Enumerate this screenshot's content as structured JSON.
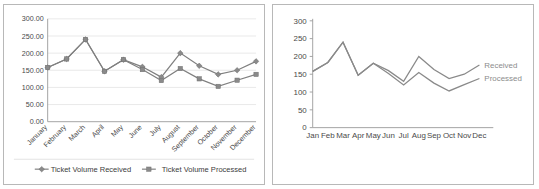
{
  "chart_data": [
    {
      "type": "line",
      "id": "left-original-chart",
      "title": "",
      "xlabel": "",
      "ylabel": "",
      "grid": true,
      "markers": true,
      "legend_position": "bottom",
      "ylim": [
        0,
        300
      ],
      "ytick_labels": [
        "0.00",
        "50.00",
        "100.00",
        "150.00",
        "200.00",
        "250.00",
        "300.00"
      ],
      "ytick_values": [
        0,
        50,
        100,
        150,
        200,
        250,
        300
      ],
      "categories": [
        "January",
        "February",
        "March",
        "April",
        "May",
        "June",
        "July",
        "August",
        "September",
        "October",
        "November",
        "December"
      ],
      "series": [
        {
          "name": "Ticket Volume Received",
          "marker": "diamond",
          "color": "#808080",
          "values": [
            158,
            183,
            240,
            147,
            181,
            160,
            130,
            200,
            163,
            138,
            150,
            176
          ]
        },
        {
          "name": "Ticket Volume Processed",
          "marker": "square",
          "color": "#808080",
          "values": [
            158,
            183,
            240,
            147,
            181,
            152,
            120,
            155,
            125,
            103,
            121,
            138
          ]
        }
      ]
    },
    {
      "type": "line",
      "id": "right-redesigned-chart",
      "title": "",
      "xlabel": "",
      "ylabel": "",
      "grid": false,
      "markers": false,
      "legend_position": "direct-label-right",
      "ylim": [
        0,
        300
      ],
      "ytick_labels": [
        "0",
        "50",
        "100",
        "150",
        "200",
        "250",
        "300"
      ],
      "ytick_values": [
        0,
        50,
        100,
        150,
        200,
        250,
        300
      ],
      "categories": [
        "Jan",
        "Feb",
        "Mar",
        "Apr",
        "May",
        "Jun",
        "Jul",
        "Aug",
        "Sep",
        "Oct",
        "Nov",
        "Dec"
      ],
      "series": [
        {
          "name": "Received",
          "marker": "none",
          "color": "#808080",
          "values": [
            158,
            183,
            240,
            147,
            181,
            160,
            130,
            200,
            163,
            138,
            150,
            176
          ]
        },
        {
          "name": "Processed",
          "marker": "none",
          "color": "#808080",
          "values": [
            158,
            183,
            240,
            147,
            181,
            152,
            120,
            155,
            125,
            103,
            121,
            138
          ]
        }
      ]
    }
  ],
  "left_chart": {
    "legend": {
      "received_label": "Ticket Volume Received",
      "processed_label": "Ticket Volume Processed"
    }
  },
  "right_chart": {
    "labels": {
      "received_label": "Received",
      "processed_label": "Processed"
    }
  },
  "colors": {
    "line": "#808080",
    "grid": "#e3e3e3",
    "axis": "#9a9a9a",
    "text": "#4a4a4a",
    "series_label": "#8c8c8c",
    "panel_border": "#b8b8b8",
    "background": "#ffffff"
  }
}
